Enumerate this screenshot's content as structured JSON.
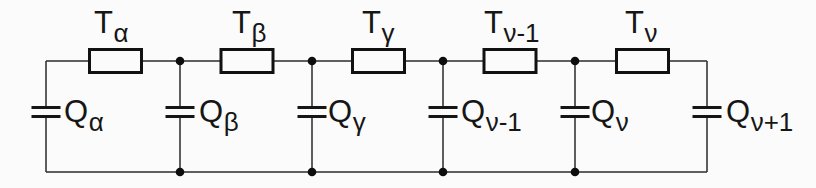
{
  "figure": {
    "kind": "rc-ladder-network-circuit",
    "colors": {
      "background": "#fbfbfb",
      "line": "#1a1a1a"
    },
    "resistors": [
      {
        "name": "T",
        "sub": "α"
      },
      {
        "name": "T",
        "sub": "β"
      },
      {
        "name": "T",
        "sub": "γ"
      },
      {
        "name": "T",
        "sub": "ν-1"
      },
      {
        "name": "T",
        "sub": "ν"
      }
    ],
    "capacitors": [
      {
        "name": "Q",
        "sub": "α"
      },
      {
        "name": "Q",
        "sub": "β"
      },
      {
        "name": "Q",
        "sub": "γ"
      },
      {
        "name": "Q",
        "sub": "ν-1"
      },
      {
        "name": "Q",
        "sub": "ν"
      },
      {
        "name": "Q",
        "sub": "ν+1"
      }
    ]
  }
}
